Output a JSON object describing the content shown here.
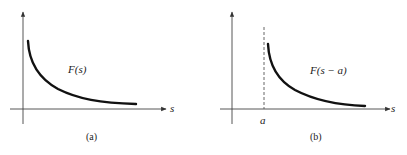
{
  "panels": [
    {
      "id": "a",
      "caption": "(a)",
      "function_label": "F(s)",
      "x_axis_label": "s",
      "description": "Decreasing curve F(s) starting near the y-axis and decaying toward the s-axis"
    },
    {
      "id": "b",
      "caption": "(b)",
      "function_label": "F(s − a)",
      "x_axis_label": "s",
      "shift_label": "a",
      "description": "Same curve shifted right by a; dashed vertical line marks s = a"
    }
  ],
  "colors": {
    "axis": "#444444",
    "curve": "#111111",
    "background": "#ffffff"
  }
}
